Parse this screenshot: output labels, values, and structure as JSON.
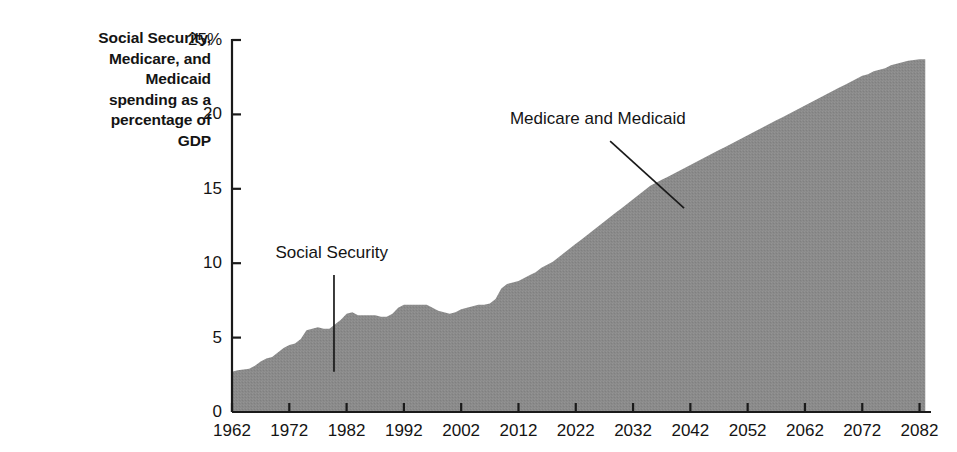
{
  "title": {
    "lines": [
      "Social Security,",
      "Medicare, and",
      "Medicaid",
      "spending as a",
      "percentage of",
      "GDP"
    ]
  },
  "chart_data": {
    "type": "area",
    "title": "Social Security, Medicare, and Medicaid spending as a percentage of GDP",
    "xlabel": "",
    "ylabel": "Social Security, Medicare, and Medicaid spending as a percentage of GDP",
    "xlim": [
      1962,
      2084
    ],
    "ylim": [
      0,
      25
    ],
    "ytick_labels": [
      "0",
      "5",
      "10",
      "15",
      "20",
      "25%"
    ],
    "yticks": [
      0,
      5,
      10,
      15,
      20,
      25
    ],
    "xticks": [
      1962,
      1972,
      1982,
      1992,
      2002,
      2012,
      2022,
      2032,
      2042,
      2052,
      2062,
      2072,
      2082
    ],
    "xtick_labels": [
      "1962",
      "1972",
      "1982",
      "1992",
      "2002",
      "2012",
      "2022",
      "2032",
      "2042",
      "2052",
      "2062",
      "2072",
      "2082"
    ],
    "grid": false,
    "legend": "none",
    "fill_color": "#8a8a8a",
    "axis_color": "#1a1a1a",
    "annotations": [
      {
        "text": "Social Security",
        "label_x": 1969.6,
        "label_y": 10.6,
        "leader": {
          "x1": 1979.8,
          "y1": 9.2,
          "x2": 1979.8,
          "y2": 2.7
        }
      },
      {
        "text": "Medicare and Medicaid",
        "label_x": 2010.5,
        "label_y": 19.6,
        "leader": {
          "x1": 2028.0,
          "y1": 18.2,
          "x2": 2040.9,
          "y2": 13.7
        }
      }
    ],
    "x": [
      1962,
      1963,
      1964,
      1965,
      1966,
      1967,
      1968,
      1969,
      1970,
      1971,
      1972,
      1973,
      1974,
      1975,
      1976,
      1977,
      1978,
      1979,
      1980,
      1981,
      1982,
      1983,
      1984,
      1985,
      1986,
      1987,
      1988,
      1989,
      1990,
      1991,
      1992,
      1993,
      1994,
      1995,
      1996,
      1997,
      1998,
      1999,
      2000,
      2001,
      2002,
      2003,
      2004,
      2005,
      2006,
      2007,
      2008,
      2009,
      2010,
      2011,
      2012,
      2013,
      2014,
      2015,
      2016,
      2017,
      2018,
      2019,
      2020,
      2021,
      2022,
      2023,
      2024,
      2025,
      2026,
      2027,
      2028,
      2029,
      2030,
      2031,
      2032,
      2033,
      2034,
      2035,
      2036,
      2037,
      2038,
      2039,
      2040,
      2041,
      2042,
      2043,
      2044,
      2045,
      2046,
      2047,
      2048,
      2049,
      2050,
      2051,
      2052,
      2053,
      2054,
      2055,
      2056,
      2057,
      2058,
      2059,
      2060,
      2061,
      2062,
      2063,
      2064,
      2065,
      2066,
      2067,
      2068,
      2069,
      2070,
      2071,
      2072,
      2073,
      2074,
      2075,
      2076,
      2077,
      2078,
      2079,
      2080,
      2081,
      2082,
      2083
    ],
    "values": [
      2.7,
      2.8,
      2.85,
      2.9,
      3.1,
      3.4,
      3.6,
      3.7,
      4.0,
      4.3,
      4.5,
      4.6,
      4.9,
      5.5,
      5.6,
      5.7,
      5.6,
      5.6,
      5.9,
      6.2,
      6.6,
      6.7,
      6.5,
      6.5,
      6.5,
      6.5,
      6.4,
      6.4,
      6.6,
      7.0,
      7.2,
      7.2,
      7.2,
      7.2,
      7.2,
      7.0,
      6.8,
      6.7,
      6.6,
      6.7,
      6.9,
      7.0,
      7.1,
      7.2,
      7.2,
      7.3,
      7.6,
      8.3,
      8.6,
      8.7,
      8.8,
      9.0,
      9.2,
      9.4,
      9.7,
      9.9,
      10.1,
      10.4,
      10.7,
      11.0,
      11.3,
      11.6,
      11.9,
      12.2,
      12.5,
      12.8,
      13.1,
      13.4,
      13.7,
      14.0,
      14.3,
      14.6,
      14.9,
      15.2,
      15.4,
      15.6,
      15.8,
      16.0,
      16.2,
      16.4,
      16.6,
      16.8,
      17.0,
      17.2,
      17.4,
      17.6,
      17.8,
      18.0,
      18.2,
      18.4,
      18.6,
      18.8,
      19.0,
      19.2,
      19.4,
      19.6,
      19.8,
      20.0,
      20.2,
      20.4,
      20.6,
      20.8,
      21.0,
      21.2,
      21.4,
      21.6,
      21.8,
      22.0,
      22.2,
      22.4,
      22.6,
      22.7,
      22.9,
      23.0,
      23.1,
      23.3,
      23.4,
      23.5,
      23.6,
      23.65,
      23.7,
      23.7
    ]
  }
}
